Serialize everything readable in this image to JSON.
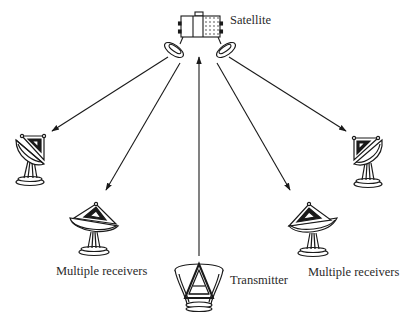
{
  "diagram": {
    "type": "satellite broadcast diagram",
    "labels": {
      "satellite": "Satellite",
      "receivers_left": "Multiple receivers",
      "transmitter": "Transmitter",
      "receivers_right": "Multiple receivers"
    },
    "nodes": [
      {
        "id": "satellite",
        "kind": "satellite",
        "label": "Satellite"
      },
      {
        "id": "transmitter",
        "kind": "ground-dish-transmitter",
        "label": "Transmitter"
      },
      {
        "id": "receiver-far-left",
        "kind": "ground-dish-receiver"
      },
      {
        "id": "receiver-mid-left",
        "kind": "ground-dish-receiver",
        "label": "Multiple receivers"
      },
      {
        "id": "receiver-mid-right",
        "kind": "ground-dish-receiver",
        "label": "Multiple receivers"
      },
      {
        "id": "receiver-far-right",
        "kind": "ground-dish-receiver"
      }
    ],
    "edges": [
      {
        "from": "transmitter",
        "to": "satellite",
        "direction": "uplink"
      },
      {
        "from": "satellite",
        "to": "receiver-far-left",
        "direction": "downlink"
      },
      {
        "from": "satellite",
        "to": "receiver-mid-left",
        "direction": "downlink"
      },
      {
        "from": "satellite",
        "to": "receiver-mid-right",
        "direction": "downlink"
      },
      {
        "from": "satellite",
        "to": "receiver-far-right",
        "direction": "downlink"
      }
    ],
    "colors": {
      "stroke": "#1a1a1a",
      "background": "#ffffff"
    }
  }
}
